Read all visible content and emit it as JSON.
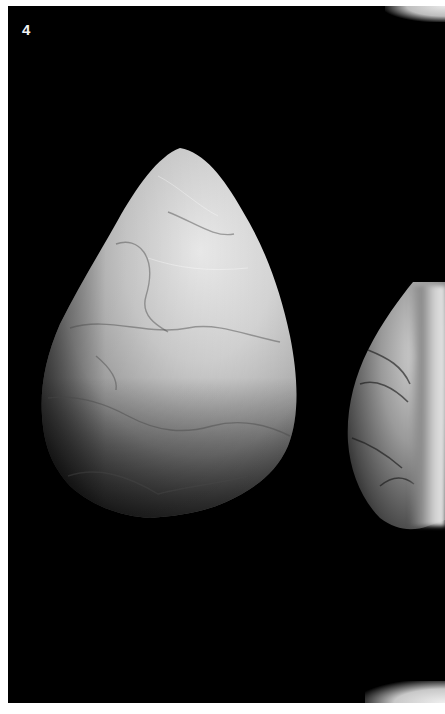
{
  "plate": {
    "label": "4",
    "background_color": "#000000",
    "label_color": "#f2f2f2"
  },
  "artifacts": [
    {
      "name": "hand-axe",
      "description": "Large flaked stone hand axe, pointed top, broad rounded base",
      "tone": "light grey"
    },
    {
      "name": "partial-hand-axe",
      "description": "Second flaked stone tool partially visible at right edge",
      "tone": "mottled grey"
    }
  ],
  "annotations": {
    "specimen_number_visible": "…5760"
  }
}
